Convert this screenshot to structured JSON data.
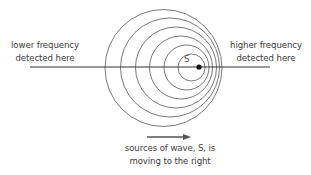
{
  "diagram": {
    "labels": {
      "left_line1": "lower frequency",
      "left_line2": "detected here",
      "right_line1": "higher frequency",
      "right_line2": "detected here",
      "bottom_line1": "sources of wave, S, is",
      "bottom_line2": "moving to the right",
      "source": "S"
    },
    "geometry": {
      "axis_line": {
        "x1": 30,
        "x2": 270,
        "y": 67
      },
      "source_dot": {
        "cx": 199,
        "cy": 67,
        "r": 2.6
      },
      "wavefronts": [
        {
          "cx": 191.5,
          "cy": 67.5,
          "r": 13.5
        },
        {
          "cx": 186.5,
          "cy": 67.5,
          "r": 22.5
        },
        {
          "cx": 181,
          "cy": 67.5,
          "r": 31.5
        },
        {
          "cx": 176,
          "cy": 67.5,
          "r": 40.5
        },
        {
          "cx": 170,
          "cy": 67.5,
          "r": 49.5
        },
        {
          "cx": 163.5,
          "cy": 68,
          "r": 58.5
        }
      ],
      "arrow": {
        "x1": 147,
        "x2": 191,
        "y": 137
      }
    },
    "colors": {
      "line": "#333333",
      "wavefront": "#6a6a6a",
      "dot": "#111111",
      "arrow": "#555555",
      "text": "#3d3d3d"
    }
  }
}
